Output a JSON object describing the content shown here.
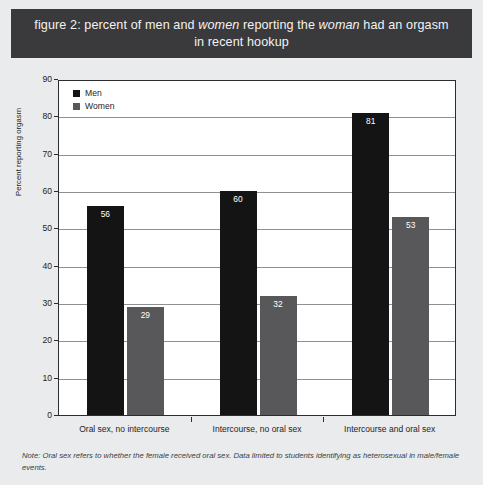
{
  "figure": {
    "title_line1_pre": "figure 2: percent of men and ",
    "title_line1_em1": "women",
    "title_line1_mid": " reporting the ",
    "title_line1_em2": "woman",
    "title_line1_post": " had an orgasm",
    "title_line2": "in recent hookup",
    "title_plain": "figure 2: percent of men and women reporting the woman had an orgasm in recent hookup",
    "footnote": "Note: Oral sex refers to whether the female received oral sex. Data limited to students identifying as heterosexual in male/female events.",
    "band_color": "#3a3a3c"
  },
  "legend": {
    "items": [
      {
        "label": "Men",
        "color": "#141414"
      },
      {
        "label": "Women",
        "color": "#58585a"
      }
    ]
  },
  "chart_data": {
    "type": "bar",
    "title": "figure 2: percent of men and women reporting the woman had an orgasm in recent hookup",
    "categories": [
      "Oral sex, no intercourse",
      "Intercourse, no oral sex",
      "Intercourse and oral sex"
    ],
    "series": [
      {
        "name": "Men",
        "color": "#141414",
        "values": [
          56,
          60,
          81
        ]
      },
      {
        "name": "Women",
        "color": "#58585a",
        "values": [
          29,
          32,
          53
        ]
      }
    ],
    "xlabel": "",
    "ylabel": "Percent reporting orgasm",
    "ylim": [
      0,
      90
    ],
    "ytick_step": 10,
    "yticks": [
      0,
      10,
      20,
      30,
      40,
      50,
      60,
      70,
      80,
      90
    ],
    "ytick_labels": [
      "0",
      "10",
      "20",
      "30",
      "40",
      "50",
      "60",
      "70",
      "80",
      "90"
    ],
    "grid": true,
    "grid_axis": "y",
    "legend_position": "top-left",
    "data_labels": true
  }
}
